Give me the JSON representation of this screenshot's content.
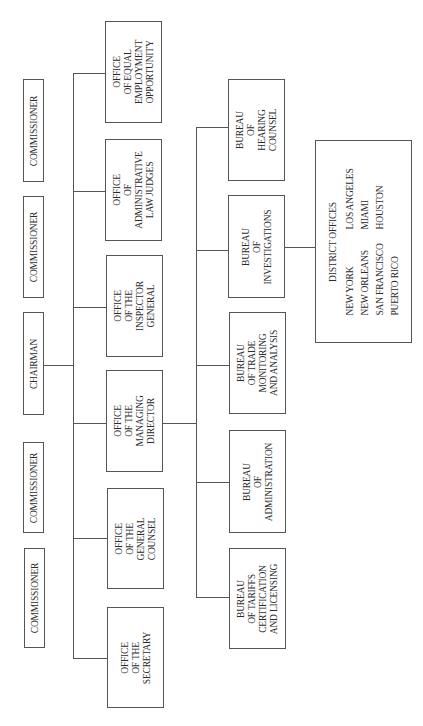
{
  "tier1": [
    {
      "label": "COMMISSIONER"
    },
    {
      "label": "COMMISSIONER"
    },
    {
      "label": "CHAIRMAN"
    },
    {
      "label": "COMMISSIONER"
    },
    {
      "label": "COMMISSIONER"
    }
  ],
  "tier2": [
    {
      "lines": [
        "OFFICE",
        "OF EQUAL",
        "EMPLOYMENT",
        "OPPORTUNITY"
      ]
    },
    {
      "lines": [
        "OFFICE",
        "OF",
        "ADMINISTRATIVE",
        "LAW JUDGES"
      ]
    },
    {
      "lines": [
        "OFFICE",
        "OF THE",
        "INSPECTOR",
        "GENERAL"
      ]
    },
    {
      "lines": [
        "OFFICE",
        "OF THE",
        "MANAGING",
        "DIRECTOR"
      ]
    },
    {
      "lines": [
        "OFFICE",
        "OF THE",
        "GENERAL",
        "COUNSEL"
      ]
    },
    {
      "lines": [
        "OFFICE",
        "OF THE",
        "SECRETARY"
      ]
    }
  ],
  "tier3": [
    {
      "lines": [
        "BUREAU",
        "OF",
        "HEARING",
        "COUNSEL"
      ]
    },
    {
      "lines": [
        "BUREAU",
        "OF",
        "INVESTIGATIONS"
      ]
    },
    {
      "lines": [
        "BUREAU",
        "OF TRADE",
        "MONITORING",
        "AND ANALYSIS"
      ]
    },
    {
      "lines": [
        "BUREAU",
        "OF",
        "ADMINISTRATION"
      ]
    },
    {
      "lines": [
        "BUREAU",
        "OF TARIFFS",
        "CERTIFICATION",
        "AND LICENSING"
      ]
    }
  ],
  "district_offices": {
    "heading": "DISTRICT OFFICES",
    "offices": [
      "NEW YORK",
      "LOS ANGELES",
      "NEW ORLEANS",
      "MIAMI",
      "SAN FRANCISCO",
      "HOUSTON",
      "PUERTO RICO"
    ]
  }
}
